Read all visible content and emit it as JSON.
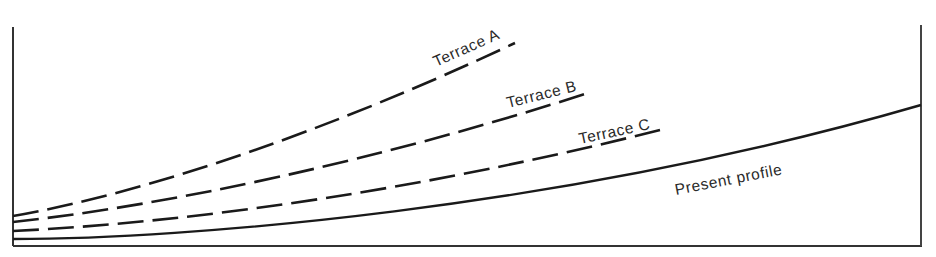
{
  "diagram": {
    "type": "river terrace profile diagram",
    "frame_color": "#333333",
    "line_color": "#1a1a1a",
    "series": [
      {
        "id": "terrace-a",
        "label": "Terrace A",
        "style": "dashed",
        "path": "M13,216 C150,192 330,130 515,43",
        "label_pos": [
          436,
          67
        ],
        "label_rot": -24
      },
      {
        "id": "terrace-b",
        "label": "Terrace B",
        "style": "dashed",
        "path": "M13,222 C170,205 380,160 588,93",
        "label_pos": [
          508,
          108
        ],
        "label_rot": -14
      },
      {
        "id": "terrace-c",
        "label": "Terrace C",
        "style": "dashed",
        "path": "M13,231 C200,222 430,188 660,130",
        "label_pos": [
          580,
          144
        ],
        "label_rot": -12
      },
      {
        "id": "present-profile",
        "label": "Present profile",
        "style": "solid",
        "path": "M13,239 C180,239 560,210 921,105",
        "label_pos": [
          676,
          195
        ],
        "label_rot": -11
      }
    ]
  }
}
